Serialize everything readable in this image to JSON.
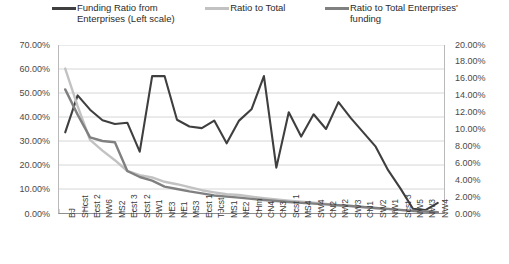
{
  "chart_data": {
    "type": "line",
    "title": "",
    "xlabel": "",
    "ylabel": "",
    "grid": true,
    "legend_position": "top",
    "categories": [
      "BJ",
      "SHcst",
      "Ecst 2",
      "NW6",
      "MS2",
      "Ecst 3",
      "Scst 2",
      "SW1",
      "NE3",
      "NE1",
      "MS3",
      "Ecst 1",
      "TJcst",
      "MS1",
      "NE2",
      "CHm",
      "CN4",
      "CN3",
      "Scst 1",
      "MS4",
      "SW4",
      "CN2",
      "NW2",
      "SW3",
      "CN1",
      "SW2",
      "NW1",
      "Scst 3",
      "NW5",
      "NW3",
      "NW4"
    ],
    "y_axis_left": {
      "ticks": [
        "0.00%",
        "10.00%",
        "20.00%",
        "30.00%",
        "40.00%",
        "50.00%",
        "60.00%",
        "70.00%"
      ],
      "min": 0,
      "max": 70,
      "step": 10
    },
    "y_axis_right": {
      "ticks": [
        "0.00%",
        "2.00%",
        "4.00%",
        "6.00%",
        "8.00%",
        "10.00%",
        "12.00%",
        "14.00%",
        "16.00%",
        "18.00%",
        "20.00%"
      ],
      "min": 0,
      "max": 20,
      "step": 2
    },
    "series": [
      {
        "name": "Funding Ratio from Enterprises (Left scale)",
        "axis": "right",
        "color": "#3f3f3f",
        "values": [
          9.6,
          14.0,
          12.3,
          11.05,
          10.6,
          10.75,
          7.3,
          16.3,
          16.3,
          11.1,
          10.3,
          10.1,
          11.0,
          8.3,
          11.0,
          12.35,
          16.3,
          5.4,
          12.0,
          9.1,
          11.75,
          10.0,
          13.2,
          11.3,
          9.6,
          7.9,
          5.1,
          2.9,
          0.5,
          0.35,
          1.2
        ]
      },
      {
        "name": "Ratio to Total",
        "axis": "left",
        "color": "#c2c2c2",
        "values": [
          60.2,
          44.5,
          30.5,
          26.0,
          22.0,
          17.5,
          15.8,
          14.8,
          13.0,
          12.0,
          10.8,
          9.5,
          8.6,
          7.8,
          7.5,
          6.8,
          6.2,
          5.6,
          5.1,
          4.7,
          4.3,
          3.8,
          3.3,
          2.9,
          2.4,
          2.0,
          1.6,
          1.2,
          0.8,
          0.5,
          0.3
        ]
      },
      {
        "name": "Ratio to Total Enterprises' funding",
        "axis": "left",
        "color": "#808080",
        "values": [
          51.5,
          41.0,
          31.5,
          30.0,
          29.5,
          17.5,
          15.0,
          13.5,
          11.0,
          10.0,
          9.0,
          8.2,
          7.3,
          6.8,
          6.4,
          5.9,
          5.4,
          5.0,
          4.6,
          4.2,
          3.9,
          3.6,
          3.2,
          2.9,
          2.5,
          2.1,
          1.7,
          1.3,
          0.9,
          0.6,
          0.35
        ]
      }
    ]
  },
  "legend": {
    "items": [
      {
        "label": "Funding Ratio from\nEnterprises (Left scale)",
        "color": "#3f3f3f"
      },
      {
        "label": "Ratio to Total",
        "color": "#c2c2c2"
      },
      {
        "label": "Ratio to Total Enterprises'\nfunding",
        "color": "#808080"
      }
    ]
  }
}
